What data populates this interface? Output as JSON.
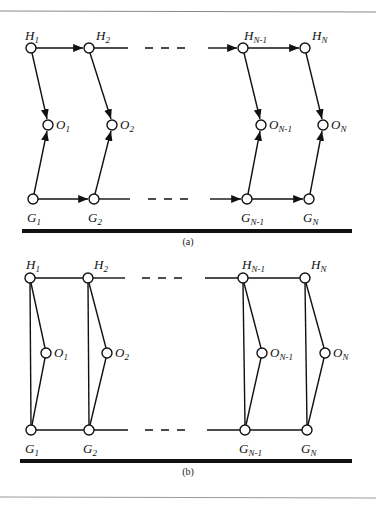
{
  "figure": {
    "panels": [
      {
        "id": "a",
        "caption": "(a)",
        "directed": true,
        "rows": {
          "H": [
            {
              "label": "H",
              "sub": "1"
            },
            {
              "label": "H",
              "sub": "2"
            },
            {
              "label": "H",
              "sub": "N-1"
            },
            {
              "label": "H",
              "sub": "N"
            }
          ],
          "O": [
            {
              "label": "O",
              "sub": "1"
            },
            {
              "label": "O",
              "sub": "2"
            },
            {
              "label": "O",
              "sub": "N-1"
            },
            {
              "label": "O",
              "sub": "N"
            }
          ],
          "G": [
            {
              "label": "G",
              "sub": "1"
            },
            {
              "label": "G",
              "sub": "2"
            },
            {
              "label": "G",
              "sub": "N-1"
            },
            {
              "label": "G",
              "sub": "N"
            }
          ]
        },
        "edges": [
          "H_i -> H_i+1",
          "G_i -> G_i+1",
          "H_i -> O_i",
          "G_i -> O_i"
        ]
      },
      {
        "id": "b",
        "caption": "(b)",
        "directed": false,
        "rows": {
          "H": [
            {
              "label": "H",
              "sub": "1"
            },
            {
              "label": "H",
              "sub": "2"
            },
            {
              "label": "H",
              "sub": "N-1"
            },
            {
              "label": "H",
              "sub": "N"
            }
          ],
          "O": [
            {
              "label": "O",
              "sub": "1"
            },
            {
              "label": "O",
              "sub": "2"
            },
            {
              "label": "O",
              "sub": "N-1"
            },
            {
              "label": "O",
              "sub": "N"
            }
          ],
          "G": [
            {
              "label": "G",
              "sub": "1"
            },
            {
              "label": "G",
              "sub": "2"
            },
            {
              "label": "G",
              "sub": "N-1"
            },
            {
              "label": "G",
              "sub": "N"
            }
          ]
        },
        "edges": [
          "H_i - H_i+1",
          "G_i - G_i+1",
          "H_i - O_i",
          "G_i - O_i",
          "H_i - G_i"
        ]
      }
    ]
  }
}
